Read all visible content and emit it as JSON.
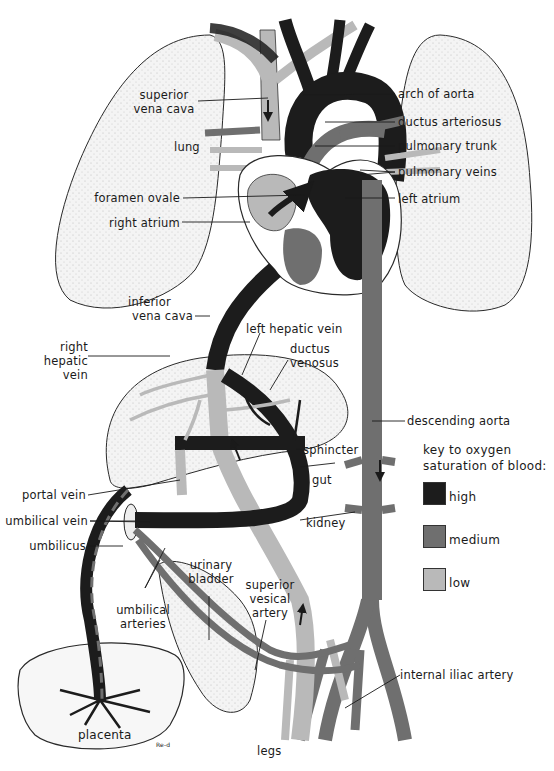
{
  "colors": {
    "high": "#1c1c1c",
    "medium": "#6f6f6f",
    "low": "#b9b9b9",
    "organ_fill": "#f3f3f3",
    "outline": "#2a2a2a"
  },
  "labels": {
    "superior_vena_cava": [
      "superior",
      "vena cava"
    ],
    "lung": "lung",
    "foramen_ovale": "foramen ovale",
    "right_atrium": "right atrium",
    "arch_of_aorta": "arch of aorta",
    "ductus_arteriosus": "ductus arteriosus",
    "pulmonary_trunk": "pulmonary trunk",
    "pulmonary_veins": "pulmonary veins",
    "left_atrium": "left atrium",
    "inferior_vena_cava": [
      "inferior",
      "vena cava"
    ],
    "left_hepatic_vein": "left hepatic vein",
    "ductus_venosus": [
      "ductus",
      "venosus"
    ],
    "right_hepatic_vein": [
      "right",
      "hepatic",
      "vein"
    ],
    "descending_aorta": "descending aorta",
    "sphincter": "sphincter",
    "gut": "gut",
    "portal_vein": "portal vein",
    "umbilical_vein": "umbilical vein",
    "umbilicus": "umbilicus",
    "kidney": "kidney",
    "urinary_bladder": [
      "urinary",
      "bladder"
    ],
    "superior_vesical_artery": [
      "superior",
      "vesical",
      "artery"
    ],
    "umbilical_arteries": [
      "umbilical",
      "arteries"
    ],
    "internal_iliac_artery": "internal iliac artery",
    "placenta": "placenta",
    "legs": "legs",
    "signature": "Re-d"
  },
  "key": {
    "title": [
      "key to oxygen",
      "saturation of blood:"
    ],
    "items": [
      {
        "label": "high",
        "level": "high"
      },
      {
        "label": "medium",
        "level": "medium"
      },
      {
        "label": "low",
        "level": "low"
      }
    ]
  }
}
